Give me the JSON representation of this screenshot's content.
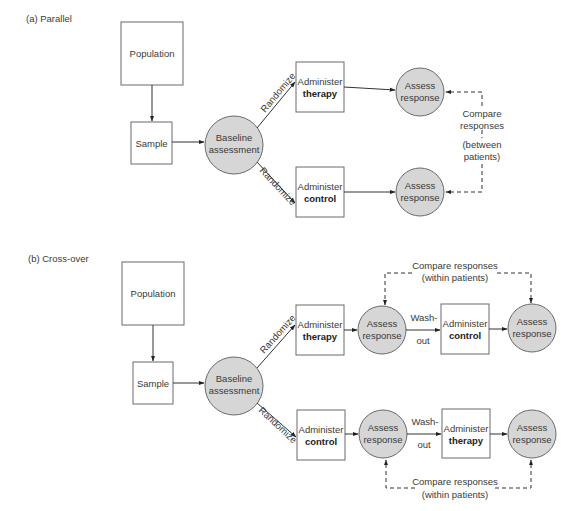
{
  "panels": {
    "parallel": {
      "title": "(a) Parallel",
      "population": "Population",
      "sample": "Sample",
      "baseline": [
        "Baseline",
        "assessment"
      ],
      "randomize_top": "Randomize",
      "randomize_bottom": "Randomize",
      "arm_therapy": [
        "Administer",
        "therapy"
      ],
      "arm_control": [
        "Administer",
        "control"
      ],
      "assess_top": [
        "Assess",
        "response"
      ],
      "assess_bottom": [
        "Assess",
        "response"
      ],
      "compare": [
        "Compare",
        "responses",
        "(between",
        "patients)"
      ]
    },
    "crossover": {
      "title": "(b) Cross-over",
      "population": "Population",
      "sample": "Sample",
      "baseline": [
        "Baseline",
        "assessment"
      ],
      "randomize_top": "Randomize",
      "randomize_bottom": "Randomize",
      "top_row": {
        "first_treatment": [
          "Administer",
          "therapy"
        ],
        "assess_1": [
          "Assess",
          "response"
        ],
        "washout": [
          "Wash-",
          "out"
        ],
        "second_treatment": [
          "Administer",
          "control"
        ],
        "assess_2": [
          "Assess",
          "response"
        ],
        "compare": [
          "Compare responses",
          "(within patients)"
        ]
      },
      "bottom_row": {
        "first_treatment": [
          "Administer",
          "control"
        ],
        "assess_1": [
          "Assess",
          "response"
        ],
        "washout": [
          "Wash-",
          "out"
        ],
        "second_treatment": [
          "Administer",
          "therapy"
        ],
        "assess_2": [
          "Assess",
          "response"
        ],
        "compare": [
          "Compare responses",
          "(within patients)"
        ]
      }
    }
  },
  "colors": {
    "circle_fill": "#d6d6d6",
    "stroke": "#6a6a6a",
    "line": "#333333",
    "text": "#3a3a3a"
  }
}
